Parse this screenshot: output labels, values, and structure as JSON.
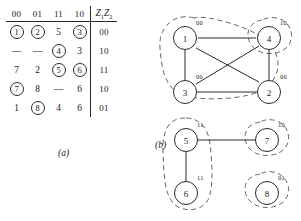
{
  "figure": {
    "table": {
      "column_headers": [
        "00",
        "01",
        "11",
        "10"
      ],
      "output_header": "Z1Z2",
      "output_header_main": "Z",
      "rows": [
        {
          "cells": [
            {
              "value": "1",
              "circled": true
            },
            {
              "value": "2",
              "circled": true
            },
            {
              "value": "5",
              "circled": false
            },
            {
              "value": "3",
              "circled": true
            }
          ],
          "output": "00"
        },
        {
          "cells": [
            {
              "value": "—",
              "circled": false
            },
            {
              "value": "—",
              "circled": false
            },
            {
              "value": "4",
              "circled": true
            },
            {
              "value": "3",
              "circled": false
            }
          ],
          "output": "10"
        },
        {
          "cells": [
            {
              "value": "7",
              "circled": false
            },
            {
              "value": "2",
              "circled": false
            },
            {
              "value": "5",
              "circled": true
            },
            {
              "value": "6",
              "circled": true
            }
          ],
          "output": "11"
        },
        {
          "cells": [
            {
              "value": "7",
              "circled": true
            },
            {
              "value": "8",
              "circled": false
            },
            {
              "value": "—",
              "circled": false
            },
            {
              "value": "6",
              "circled": false
            }
          ],
          "output": "10"
        },
        {
          "cells": [
            {
              "value": "1",
              "circled": false
            },
            {
              "value": "8",
              "circled": true
            },
            {
              "value": "4",
              "circled": false
            },
            {
              "value": "6",
              "circled": false
            }
          ],
          "output": "01"
        }
      ]
    },
    "caption_a": "(a)",
    "caption_b": "(b)",
    "graph_top": {
      "nodes": [
        {
          "id": "1",
          "label": "1",
          "sup": "00"
        },
        {
          "id": "4",
          "label": "4",
          "sup": "10"
        },
        {
          "id": "3",
          "label": "3",
          "sup": "00"
        },
        {
          "id": "2",
          "label": "2",
          "sup": "00"
        }
      ],
      "edges": [
        {
          "from": "1",
          "to": "4"
        },
        {
          "from": "1",
          "to": "3"
        },
        {
          "from": "1",
          "to": "2"
        },
        {
          "from": "4",
          "to": "2"
        },
        {
          "from": "4",
          "to": "3"
        },
        {
          "from": "3",
          "to": "2"
        }
      ],
      "groups": [
        {
          "members": [
            "1",
            "3",
            "2"
          ]
        },
        {
          "members": [
            "4"
          ]
        }
      ]
    },
    "graph_bottom": {
      "nodes": [
        {
          "id": "5",
          "label": "5",
          "sup": "11"
        },
        {
          "id": "7",
          "label": "7",
          "sup": "10"
        },
        {
          "id": "6",
          "label": "6",
          "sup": "11"
        },
        {
          "id": "8",
          "label": "8",
          "sup": "01"
        }
      ],
      "edges": [
        {
          "from": "5",
          "to": "7"
        },
        {
          "from": "5",
          "to": "6"
        }
      ],
      "groups": [
        {
          "members": [
            "5",
            "6"
          ]
        },
        {
          "members": [
            "7"
          ]
        },
        {
          "members": [
            "8"
          ]
        }
      ]
    }
  },
  "colors": {
    "ink": "#1a1a1a",
    "rule": "#2a2a2a",
    "dashed": "#555555",
    "background": "#ffffff"
  }
}
